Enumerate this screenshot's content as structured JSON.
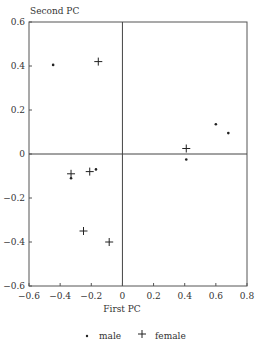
{
  "chart_data": {
    "type": "scatter",
    "title": "",
    "xlabel": "First PC",
    "ylabel": "Second PC",
    "xlim": [
      -0.6,
      0.8
    ],
    "ylim": [
      -0.6,
      0.6
    ],
    "xticks": [
      "-0.6",
      "-0.4",
      "-0.2",
      "0",
      "0.2",
      "0.4",
      "0.6",
      "0.8"
    ],
    "yticks": [
      "0.6",
      "0.4",
      "0.2",
      "0",
      "-0.2",
      "-0.4",
      "-0.6"
    ],
    "grid": false,
    "legend_position": "bottom",
    "series": [
      {
        "name": "male",
        "marker": "dot",
        "points": [
          {
            "x": -0.445,
            "y": 0.405
          },
          {
            "x": -0.33,
            "y": -0.11
          },
          {
            "x": -0.17,
            "y": -0.07
          },
          {
            "x": 0.41,
            "y": -0.025
          },
          {
            "x": 0.6,
            "y": 0.135
          },
          {
            "x": 0.68,
            "y": 0.095
          }
        ]
      },
      {
        "name": "female",
        "marker": "plus",
        "points": [
          {
            "x": -0.155,
            "y": 0.42
          },
          {
            "x": -0.33,
            "y": -0.09
          },
          {
            "x": -0.21,
            "y": -0.08
          },
          {
            "x": -0.25,
            "y": -0.35
          },
          {
            "x": -0.085,
            "y": -0.4
          },
          {
            "x": 0.41,
            "y": 0.025
          }
        ]
      }
    ]
  },
  "legend": {
    "male_label": "male",
    "female_label": "female"
  }
}
